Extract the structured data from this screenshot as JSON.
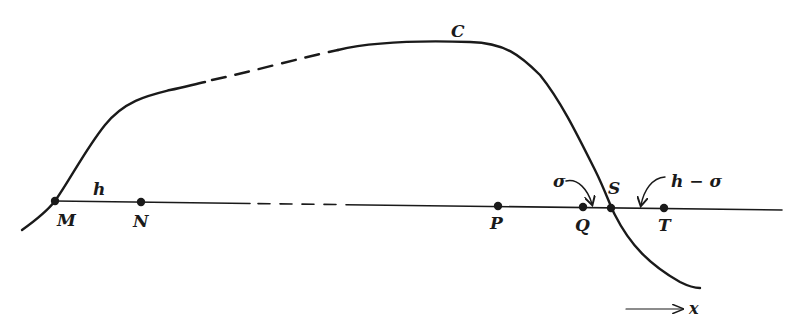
{
  "figure": {
    "curve_label": "C",
    "baseline_segment_label": "h",
    "points": [
      {
        "id": "M",
        "label": "M",
        "x": 55,
        "y": 201
      },
      {
        "id": "N",
        "label": "N",
        "x": 141,
        "y": 202
      },
      {
        "id": "P",
        "label": "P",
        "x": 498,
        "y": 206
      },
      {
        "id": "Q",
        "label": "Q",
        "x": 583,
        "y": 207
      },
      {
        "id": "S",
        "label": "S",
        "x": 611,
        "y": 208
      },
      {
        "id": "T",
        "label": "T",
        "x": 664,
        "y": 208
      }
    ],
    "annotations": {
      "sigma": "σ",
      "h_minus_sigma": "h − σ"
    },
    "axis": {
      "label": "x"
    },
    "colors": {
      "ink": "#1a1a1a",
      "background": "#ffffff"
    }
  }
}
